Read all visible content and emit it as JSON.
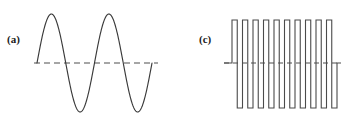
{
  "figure": {
    "background_color": "#ffffff",
    "stroke_color": "#3a3a3a",
    "baseline_color": "#4e4e4e",
    "width": 354,
    "height": 132
  },
  "panels": [
    {
      "id": "a",
      "label": "(a)",
      "waveform": "sine",
      "description": "sinusoidal waveform",
      "baseline": {
        "y": 63,
        "x_start": 34,
        "x_end": 158,
        "style": "dashed"
      },
      "geometry": {
        "x_start": 37,
        "x_end": 152,
        "center_y": 63,
        "amplitude": 49,
        "cycles": 2,
        "peak_y": 14,
        "trough_y": 112,
        "phase": "rising-at-start"
      }
    },
    {
      "id": "c",
      "label": "(c)",
      "waveform": "square",
      "description": "square / pulse waveform",
      "baseline": {
        "y": 63,
        "x_start": 47,
        "x_end": 164,
        "style": "dashed"
      },
      "geometry": {
        "x_start": 55,
        "x_end": 160,
        "center_y": 63,
        "top_y": 20,
        "bottom_y": 108,
        "pulse_count": 10,
        "period": 10.5,
        "duty_cycle": 0.5,
        "lead_in_x": 47,
        "lead_out_x": 164
      }
    }
  ],
  "chart_data": {
    "type": "line",
    "title": "",
    "xlabel": "",
    "ylabel": "",
    "grid": false,
    "legend": false,
    "series": [
      {
        "name": "(a) sine wave",
        "waveform": "sine",
        "cycles": 2,
        "amplitude": 1,
        "baseline": 0,
        "points_note": "y = sin(2*pi*2*x) over x in [0,1]"
      },
      {
        "name": "(c) square wave",
        "waveform": "square",
        "pulses": 10,
        "amplitude": 1,
        "baseline": 0,
        "duty_cycle": 0.5,
        "points_note": "y = sign(sin(2*pi*10*x)) over x in [0,1]"
      }
    ]
  }
}
